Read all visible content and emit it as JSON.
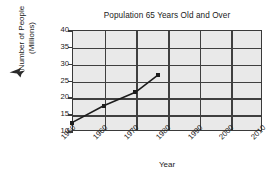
{
  "chart_data": {
    "type": "line",
    "title": "Population 65 Years Old and Over",
    "xlabel": "Year",
    "ylabel": "Number of People (Millions)",
    "ylabel_line1": "Number of People",
    "ylabel_line2": "(Millions)",
    "x": [
      1950,
      1960,
      1970,
      1977
    ],
    "values": [
      12.5,
      17.5,
      21.5,
      26.5
    ],
    "series": [
      {
        "name": "Population 65 and over",
        "points": [
          {
            "x": 1950,
            "y": 12.5
          },
          {
            "x": 1960,
            "y": 17.5
          },
          {
            "x": 1970,
            "y": 21.5
          },
          {
            "x": 1977,
            "y": 26.5
          }
        ]
      }
    ],
    "xlim": [
      1950,
      2010
    ],
    "ylim": [
      10,
      40
    ],
    "xticks": [
      1950,
      1960,
      1970,
      1980,
      1990,
      2000,
      2010
    ],
    "yticks": [
      10,
      15,
      20,
      25,
      30,
      35,
      40
    ],
    "xtick_labels": [
      "1950",
      "1960",
      "1970",
      "1980",
      "1990",
      "2000",
      "2010"
    ],
    "ytick_labels": [
      "10",
      "15",
      "20",
      "25",
      "30",
      "35",
      "40"
    ],
    "grid": true,
    "legend": null,
    "marker": "square",
    "line_color": "#1c1c1c",
    "plot_background": "#e9e9e9",
    "grid_color": "#3f3f3f",
    "axis_color": "#3a3a3a"
  },
  "annotations": {
    "cursor_icon": "pointer-arrow-icon"
  }
}
